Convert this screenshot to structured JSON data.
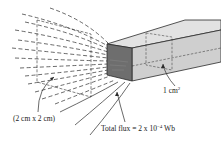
{
  "diagram": {
    "type": "physics-illustration",
    "labels": {
      "frame_area": "(2 cm x 2 cm)",
      "bar_area_value": "1 cm",
      "bar_area_exp": "2",
      "flux_prefix": "Total flux = 2 x 10",
      "flux_exp": "−4",
      "flux_unit": " Wb"
    },
    "elements": [
      {
        "id": "field-lines",
        "description": "dashed curved field lines fanning out to the left and converging into the bar"
      },
      {
        "id": "frame",
        "description": "dashed parallelogram representing a 2 cm x 2 cm area"
      },
      {
        "id": "bar",
        "description": "3D rectangular bar with shaded front face, 1 cm² cross-section"
      },
      {
        "id": "cross-section",
        "description": "dashed cross-section plane inside the bar"
      }
    ],
    "colors": {
      "line": "#2a2a2a",
      "bar_front": "#6e6e6e",
      "bar_top": "#dcdcdc",
      "bar_side": "#c8c8c8",
      "background": "#ffffff"
    }
  }
}
